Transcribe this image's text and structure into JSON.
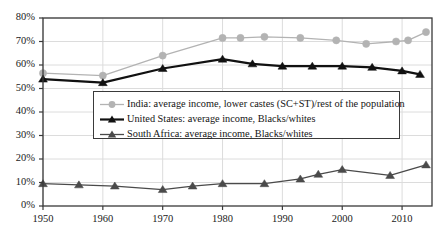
{
  "chart_data": {
    "type": "line",
    "title": "",
    "xlabel": "",
    "ylabel": "",
    "xlim": [
      1950,
      2015
    ],
    "ylim": [
      0,
      80
    ],
    "grid": true,
    "legend_position": "center",
    "y_ticks": [
      "0%",
      "10%",
      "20%",
      "30%",
      "40%",
      "50%",
      "60%",
      "70%",
      "80%"
    ],
    "y_tick_values": [
      0,
      10,
      20,
      30,
      40,
      50,
      60,
      70,
      80
    ],
    "x_ticks": [
      "1950",
      "1960",
      "1970",
      "1980",
      "1990",
      "2000",
      "2010"
    ],
    "x_tick_values": [
      1950,
      1960,
      1970,
      1980,
      1990,
      2000,
      2010
    ],
    "series": [
      {
        "name": "India: average income, lower castes (SC+ST)/rest of the population",
        "key": "india",
        "color": "#b3b3b3",
        "marker": "circle",
        "x": [
          1950,
          1960,
          1970,
          1980,
          1983,
          1987,
          1993,
          1999,
          2004,
          2009,
          2011,
          2014
        ],
        "values": [
          56.5,
          55.5,
          64,
          71.5,
          71.5,
          72,
          71.5,
          70.5,
          69,
          70,
          70.5,
          74
        ]
      },
      {
        "name": "United States: average income, Blacks/whites",
        "key": "united_states",
        "color": "#111111",
        "marker": "triangle",
        "x": [
          1950,
          1960,
          1970,
          1980,
          1985,
          1990,
          1995,
          2000,
          2005,
          2010,
          2013
        ],
        "values": [
          54,
          52.5,
          58.5,
          62.5,
          60.5,
          59.5,
          59.5,
          59.5,
          59,
          57.5,
          56
        ]
      },
      {
        "name": "South Africa: average income, Blacks/whites",
        "key": "south_africa",
        "color": "#4a4a4a",
        "marker": "triangle",
        "x": [
          1950,
          1956,
          1962,
          1970,
          1975,
          1980,
          1987,
          1993,
          1996,
          2000,
          2008,
          2014
        ],
        "values": [
          9.5,
          9,
          8.5,
          7,
          8.5,
          9.5,
          9.5,
          11.5,
          13.5,
          15.5,
          13,
          17.5
        ]
      }
    ]
  },
  "legend": {
    "entries": [
      {
        "label": "India: average income, lower castes (SC+ST)/rest of the population",
        "marker": "circle-marker",
        "color": "#b3b3b3"
      },
      {
        "label": "United States: average income, Blacks/whites",
        "marker": "triangle-marker",
        "color": "#111111"
      },
      {
        "label": "South Africa: average income, Blacks/whites",
        "marker": "triangle-marker",
        "color": "#4a4a4a"
      }
    ]
  },
  "axes": {
    "y_labels": [
      "80%",
      "70%",
      "60%",
      "50%",
      "40%",
      "30%",
      "20%",
      "10%",
      "0%"
    ],
    "x_labels": [
      "1950",
      "1960",
      "1970",
      "1980",
      "1990",
      "2000",
      "2010"
    ]
  },
  "colors": {
    "india": "#b3b3b3",
    "united_states": "#111111",
    "south_africa": "#4a4a4a",
    "axis": "#3a3a3a",
    "grid": "#dcdcdc",
    "background": "#ffffff"
  }
}
